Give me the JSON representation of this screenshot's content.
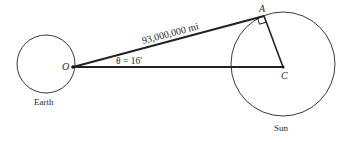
{
  "diagram": {
    "earth": {
      "label": "Earth",
      "center_point_label": "O"
    },
    "sun": {
      "label": "Sun",
      "center_point_label": "C"
    },
    "tangent_point_label": "A",
    "distance_label": "93,000,000 mi",
    "angle_label": "θ = 16′",
    "right_angle_at": "A",
    "colors": {
      "stroke": "#2a2a2a",
      "background": "#ffffff"
    }
  }
}
